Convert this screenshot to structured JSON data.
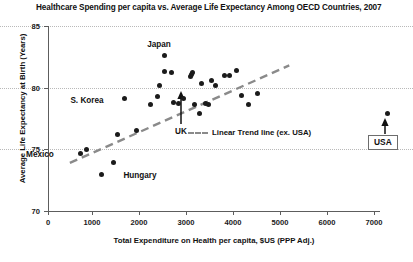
{
  "chart_data": {
    "type": "scatter",
    "title": "Healthcare Spending per capita vs. Average Life Expectancy Among OECD Countries, 2007",
    "xlabel": "Total Expenditure on Health per capita, $US (PPP Adj.)",
    "ylabel": "Average Life Expectancy at Birth (Years)",
    "xlim": [
      0,
      7500
    ],
    "ylim": [
      70,
      85
    ],
    "xticks": [
      0,
      1000,
      2000,
      3000,
      4000,
      5000,
      6000,
      7000
    ],
    "xtick_labels": [
      "0",
      "1000",
      "2000",
      "3000",
      "4000",
      "5000",
      "6000",
      "7000"
    ],
    "yticks": [
      70,
      75,
      80,
      85
    ],
    "ytick_labels": [
      "70",
      "75",
      "80",
      "85"
    ],
    "grid": "horizontal-dotted",
    "legend_position": "inside-center-right",
    "series": [
      {
        "name": "OECD Countries",
        "marker": "filled-circle",
        "color": "#1b1b1b",
        "points": [
          {
            "x": 700,
            "y": 74.7,
            "label": "Mexico"
          },
          {
            "x": 830,
            "y": 75.0
          },
          {
            "x": 1150,
            "y": 73.0,
            "label": "Hungary"
          },
          {
            "x": 1400,
            "y": 73.9
          },
          {
            "x": 1500,
            "y": 76.2
          },
          {
            "x": 1650,
            "y": 79.1,
            "label": "S. Korea"
          },
          {
            "x": 1900,
            "y": 76.5
          },
          {
            "x": 2200,
            "y": 78.6
          },
          {
            "x": 2350,
            "y": 79.3
          },
          {
            "x": 2400,
            "y": 80.2
          },
          {
            "x": 2500,
            "y": 81.3
          },
          {
            "x": 2500,
            "y": 82.6,
            "label": "Japan"
          },
          {
            "x": 2650,
            "y": 81.2
          },
          {
            "x": 2700,
            "y": 78.8
          },
          {
            "x": 2800,
            "y": 78.7
          },
          {
            "x": 2900,
            "y": 79.1,
            "label": "UK"
          },
          {
            "x": 3050,
            "y": 80.9
          },
          {
            "x": 3080,
            "y": 81.1
          },
          {
            "x": 3100,
            "y": 81.2
          },
          {
            "x": 3150,
            "y": 78.6
          },
          {
            "x": 3250,
            "y": 77.9
          },
          {
            "x": 3300,
            "y": 80.3
          },
          {
            "x": 3380,
            "y": 78.7
          },
          {
            "x": 3450,
            "y": 78.6
          },
          {
            "x": 3500,
            "y": 80.6
          },
          {
            "x": 3600,
            "y": 80.2
          },
          {
            "x": 3800,
            "y": 81.0
          },
          {
            "x": 3900,
            "y": 81.0
          },
          {
            "x": 4050,
            "y": 81.4
          },
          {
            "x": 4150,
            "y": 79.4
          },
          {
            "x": 4300,
            "y": 78.6
          },
          {
            "x": 4500,
            "y": 79.5
          },
          {
            "x": 7290,
            "y": 77.9,
            "label": "USA"
          }
        ]
      }
    ],
    "trend_line": {
      "label": "Linear Trend line (ex. USA)",
      "style": "dashed",
      "color": "#8a8a8a",
      "x_start": 470,
      "y_start": 73.9,
      "x_end": 5180,
      "y_end": 81.8
    },
    "annotations": [
      {
        "name": "japan-label",
        "text": "Japan",
        "x_px": 159,
        "y_px": 46
      },
      {
        "name": "skorea-label",
        "text": "S. Korea",
        "x_px": 87,
        "y_px": 101
      },
      {
        "name": "mexico-label",
        "text": "Mexico",
        "x_px": 40,
        "y_px": 155
      },
      {
        "name": "hungary-label",
        "text": "Hungary",
        "x_px": 140,
        "y_px": 176
      },
      {
        "name": "uk-label",
        "text": "UK",
        "x_px": 181,
        "y_px": 131
      },
      {
        "name": "usa-box-label",
        "text": "USA"
      }
    ]
  }
}
